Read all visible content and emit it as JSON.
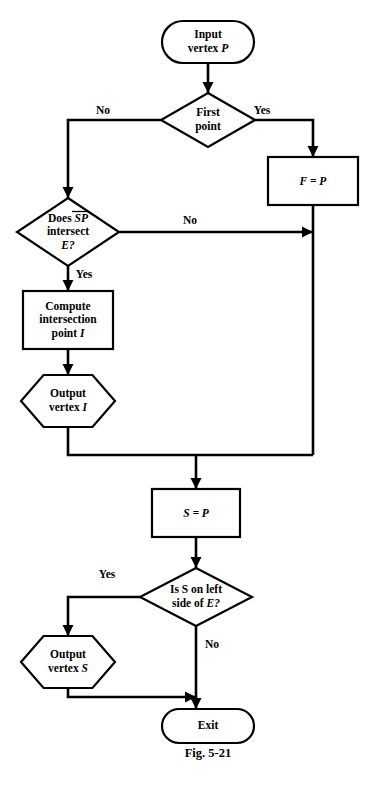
{
  "figure": {
    "caption": "Fig. 5-21",
    "caption_x": 208,
    "caption_y": 757
  },
  "nodes": [
    {
      "id": "input-vertex-p",
      "shape": "terminal",
      "name": "terminal-input-vertex-p",
      "lines": [
        "Input",
        "vertex P"
      ],
      "italic_tail": [
        "",
        "P"
      ],
      "cx": 208,
      "cy": 42,
      "w": 92,
      "h": 42
    },
    {
      "id": "first-point",
      "shape": "decision",
      "name": "decision-first-point",
      "lines": [
        "First",
        "point"
      ],
      "italic_tail": [
        "",
        ""
      ],
      "cx": 208,
      "cy": 120,
      "w": 94,
      "h": 54
    },
    {
      "id": "f-equals-p",
      "shape": "process",
      "name": "process-f-equals-p",
      "lines": [
        "F = P"
      ],
      "italic_tail": [
        "F = P"
      ],
      "cx": 313,
      "cy": 181,
      "w": 90,
      "h": 48
    },
    {
      "id": "does-sp-intersect-e",
      "shape": "decision",
      "name": "decision-does-sp-intersect-e",
      "lines": [
        "Does SP",
        "intersect",
        "E?"
      ],
      "italic_tail": [
        "SP",
        "",
        "E?"
      ],
      "cx": 68,
      "cy": 232,
      "w": 102,
      "h": 68
    },
    {
      "id": "compute-intersection",
      "shape": "process",
      "name": "process-compute-intersection-point-i",
      "lines": [
        "Compute",
        "intersection",
        "point I"
      ],
      "italic_tail": [
        "",
        "",
        "I"
      ],
      "cx": 68,
      "cy": 320,
      "w": 90,
      "h": 58
    },
    {
      "id": "output-vertex-i",
      "shape": "hexagon",
      "name": "output-vertex-i-hexagon",
      "lines": [
        "Output",
        "vertex I"
      ],
      "italic_tail": [
        "",
        "I"
      ],
      "cx": 68,
      "cy": 401,
      "w": 94,
      "h": 52
    },
    {
      "id": "s-equals-p",
      "shape": "process",
      "name": "process-s-equals-p",
      "lines": [
        "S = P"
      ],
      "italic_tail": [
        "S = P"
      ],
      "cx": 196,
      "cy": 513,
      "w": 88,
      "h": 48
    },
    {
      "id": "is-s-on-left",
      "shape": "decision",
      "name": "decision-is-s-on-left-side-of-e",
      "lines": [
        "Is S on left",
        "side of E?"
      ],
      "italic_tail": [
        "S",
        "E?"
      ],
      "cx": 196,
      "cy": 597,
      "w": 112,
      "h": 58
    },
    {
      "id": "output-vertex-s",
      "shape": "hexagon",
      "name": "output-vertex-s-hexagon",
      "lines": [
        "Output",
        "vertex S"
      ],
      "italic_tail": [
        "",
        "S"
      ],
      "cx": 68,
      "cy": 662,
      "w": 94,
      "h": 52
    },
    {
      "id": "exit",
      "shape": "terminal",
      "name": "terminal-exit",
      "lines": [
        "Exit"
      ],
      "italic_tail": [
        ""
      ],
      "cx": 208,
      "cy": 726,
      "w": 92,
      "h": 34
    }
  ],
  "edge_labels": [
    {
      "id": "first-point-no",
      "name": "edge-label-no-first-point",
      "text": "No",
      "x": 103,
      "y": 114
    },
    {
      "id": "first-point-yes",
      "name": "edge-label-yes-first-point",
      "text": "Yes",
      "x": 262,
      "y": 114
    },
    {
      "id": "sp-no",
      "name": "edge-label-no-sp-intersect",
      "text": "No",
      "x": 190,
      "y": 224
    },
    {
      "id": "sp-yes",
      "name": "edge-label-yes-sp-intersect",
      "text": "Yes",
      "x": 84,
      "y": 278
    },
    {
      "id": "left-yes",
      "name": "edge-label-yes-is-s-left",
      "text": "Yes",
      "x": 107,
      "y": 578
    },
    {
      "id": "left-no",
      "name": "edge-label-no-is-s-left",
      "text": "No",
      "x": 212,
      "y": 648
    }
  ],
  "connectors": [
    {
      "id": "c-input-to-firstpoint",
      "name": "connector-input-to-first-point",
      "d": "M 208 63 L 208 93",
      "arrow": {
        "x": 208,
        "y": 93,
        "dir": "down"
      }
    },
    {
      "id": "c-firstpoint-no",
      "name": "connector-first-point-no-to-sp",
      "d": "M 161 120 L 68 120 L 68 198",
      "arrow": {
        "x": 68,
        "y": 198,
        "dir": "down"
      }
    },
    {
      "id": "c-firstpoint-yes",
      "name": "connector-first-point-yes-to-f",
      "d": "M 255 120 L 313 120 L 313 157",
      "arrow": {
        "x": 313,
        "y": 157,
        "dir": "down"
      }
    },
    {
      "id": "c-f-down",
      "name": "connector-f-to-merge",
      "d": "M 313 205 L 313 455",
      "arrow": null
    },
    {
      "id": "c-sp-no",
      "name": "connector-sp-no-to-right-rail",
      "d": "M 119 232 L 313 232",
      "arrow": {
        "x": 313,
        "y": 232,
        "dir": "right"
      }
    },
    {
      "id": "c-sp-yes",
      "name": "connector-sp-yes-to-compute",
      "d": "M 68 266 L 68 291",
      "arrow": {
        "x": 68,
        "y": 291,
        "dir": "down"
      }
    },
    {
      "id": "c-compute-to-output-i",
      "name": "connector-compute-to-output-i",
      "d": "M 68 349 L 68 375",
      "arrow": {
        "x": 68,
        "y": 375,
        "dir": "down"
      }
    },
    {
      "id": "c-output-i-to-merge",
      "name": "connector-output-i-to-merge",
      "d": "M 68 427 L 68 455 L 313 455",
      "arrow": null
    },
    {
      "id": "c-merge-to-s-equals-p",
      "name": "connector-merge-to-s-equals-p",
      "d": "M 196 455 L 196 489",
      "arrow": {
        "x": 196,
        "y": 489,
        "dir": "down"
      }
    },
    {
      "id": "c-s-to-decision",
      "name": "connector-s-equals-p-to-decision",
      "d": "M 196 537 L 196 568",
      "arrow": {
        "x": 196,
        "y": 568,
        "dir": "down"
      }
    },
    {
      "id": "c-left-yes",
      "name": "connector-yes-to-output-s",
      "d": "M 140 597 L 68 597 L 68 636",
      "arrow": {
        "x": 68,
        "y": 636,
        "dir": "down"
      }
    },
    {
      "id": "c-left-no",
      "name": "connector-no-to-exit",
      "d": "M 196 626 L 196 709",
      "arrow": {
        "x": 196,
        "y": 709,
        "dir": "down"
      }
    },
    {
      "id": "c-output-s-to-exit",
      "name": "connector-output-s-to-exit-rail",
      "d": "M 68 688 L 68 697 L 196 697",
      "arrow": {
        "x": 196,
        "y": 697,
        "dir": "right"
      }
    }
  ]
}
